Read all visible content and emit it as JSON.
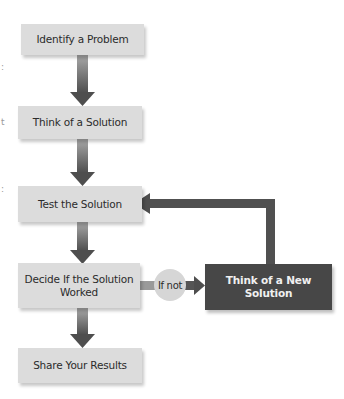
{
  "diagram": {
    "type": "flowchart",
    "steps": [
      {
        "id": "identify",
        "label": "Identify a Problem"
      },
      {
        "id": "think",
        "label": "Think of a Solution"
      },
      {
        "id": "test",
        "label": "Test the Solution"
      },
      {
        "id": "decide",
        "label": "Decide If the Solution Worked"
      },
      {
        "id": "share",
        "label": "Share Your Results"
      }
    ],
    "branch": {
      "condition_label": "If not",
      "target_label": "Think of a New Solution"
    },
    "edges": [
      {
        "from": "identify",
        "to": "think"
      },
      {
        "from": "think",
        "to": "test"
      },
      {
        "from": "test",
        "to": "decide"
      },
      {
        "from": "decide",
        "to": "share"
      },
      {
        "from": "decide",
        "to": "new_solution",
        "label": "If not"
      },
      {
        "from": "new_solution",
        "to": "test"
      }
    ],
    "colors": {
      "box_fill": "#dcdcdc",
      "dark_box_fill": "#474747",
      "arrow_top": "#a0a0a0",
      "arrow_bottom": "#505050",
      "circle_fill": "#d6d6d6"
    }
  },
  "edge_fragments": [
    ":",
    "t",
    ":"
  ]
}
